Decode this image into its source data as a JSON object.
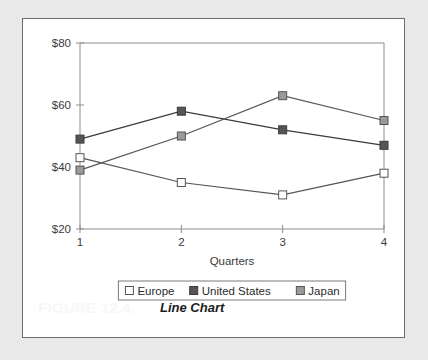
{
  "figure": {
    "number_label": "FIGURE 12.4.",
    "caption": "Line Chart"
  },
  "chart_data": {
    "type": "line",
    "title": "",
    "xlabel": "Quarters",
    "ylabel": "",
    "categories": [
      "1",
      "2",
      "3",
      "4"
    ],
    "x_tick_labels": [
      "1",
      "2",
      "3",
      "4"
    ],
    "y_tick_labels": [
      "$20",
      "$40",
      "$60",
      "$80"
    ],
    "y_tick_values": [
      20,
      40,
      60,
      80
    ],
    "ylim": [
      20,
      80
    ],
    "grid": false,
    "legend_position": "bottom",
    "series": [
      {
        "name": "Europe",
        "values": [
          43,
          35,
          31,
          38
        ],
        "marker": "square",
        "marker_fill": "#ffffff",
        "marker_stroke": "#555555",
        "line_color": "#555555"
      },
      {
        "name": "United States",
        "values": [
          49,
          58,
          52,
          47
        ],
        "marker": "square",
        "marker_fill": "#555555",
        "marker_stroke": "#3a3a3a",
        "line_color": "#3a3a3a"
      },
      {
        "name": "Japan",
        "values": [
          39,
          50,
          63,
          55
        ],
        "marker": "square",
        "marker_fill": "#9a9a9a",
        "marker_stroke": "#555555",
        "line_color": "#555555"
      }
    ]
  },
  "colors": {
    "page_background": "#e9e9e9",
    "frame_background": "#ffffff",
    "frame_border": "#6d6d6d",
    "axis": "#8c8c8c",
    "text": "#3a3a3a"
  }
}
